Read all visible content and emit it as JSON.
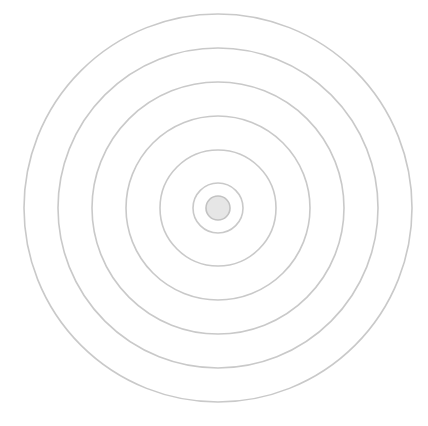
{
  "diagram": {
    "type": "concentric-circles",
    "background": "#ffffff",
    "center": {
      "x": 218,
      "y": 208
    },
    "ring_color": "#c9c9c9",
    "ring_stroke_width": 1.6,
    "rings": [
      {
        "radius": 194
      },
      {
        "radius": 160
      },
      {
        "radius": 126
      },
      {
        "radius": 92
      },
      {
        "radius": 58
      },
      {
        "radius": 25
      }
    ],
    "core": {
      "radius": 12,
      "fill": "#e6e6e6",
      "stroke": "#c2c2c2",
      "stroke_width": 1.6
    }
  }
}
